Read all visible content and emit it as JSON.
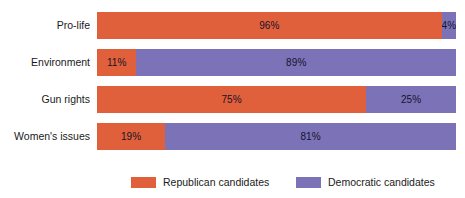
{
  "chart_data": {
    "type": "bar",
    "subtype": "stacked-horizontal-100pct",
    "title": "",
    "subtitle": "",
    "xlabel": "",
    "ylabel": "",
    "xlim": [
      0,
      100
    ],
    "grid": false,
    "legend_position": "bottom",
    "categories": [
      "Pro-life",
      "Environment",
      "Gun rights",
      "Women's issues"
    ],
    "series": [
      {
        "name": "Republican candidates",
        "color": "#e1603c",
        "values": [
          96,
          11,
          75,
          19
        ],
        "labels": [
          "96%",
          "11%",
          "75%",
          "19%"
        ]
      },
      {
        "name": "Democratic candidates",
        "color": "#7b72b8",
        "values": [
          4,
          89,
          25,
          81
        ],
        "labels": [
          "4%",
          "89%",
          "25%",
          "81%"
        ]
      }
    ]
  },
  "colors": {
    "republican": "#e1603c",
    "democratic": "#7b72b8",
    "background": "#ffffff",
    "text": "#1a1a1a",
    "bar_label_text": "#141428"
  },
  "rows": [
    {
      "label": "Pro-life",
      "rep_value": 96,
      "rep_label": "96%",
      "dem_value": 4,
      "dem_label": "4%"
    },
    {
      "label": "Environment",
      "rep_value": 11,
      "rep_label": "11%",
      "dem_value": 89,
      "dem_label": "89%"
    },
    {
      "label": "Gun rights",
      "rep_value": 75,
      "rep_label": "75%",
      "dem_value": 25,
      "dem_label": "25%"
    },
    {
      "label": "Women's issues",
      "rep_value": 19,
      "rep_label": "19%",
      "dem_value": 81,
      "dem_label": "81%"
    }
  ],
  "legend": {
    "items": [
      {
        "label": "Republican candidates",
        "color": "#e1603c"
      },
      {
        "label": "Democratic candidates",
        "color": "#7b72b8"
      }
    ]
  }
}
